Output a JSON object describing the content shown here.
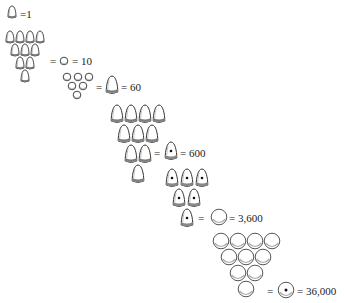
{
  "colors": {
    "stroke": "#333333",
    "shade": "#888888",
    "fill": "#ffffff"
  },
  "equations": [
    {
      "id": "small-cone",
      "token": "small-cone",
      "count": 1,
      "label": "=1"
    },
    {
      "id": "small-sphere",
      "group": {
        "token": "small-cone",
        "count": 10,
        "rows": [
          4,
          3,
          2,
          1
        ]
      },
      "token": "small-sphere",
      "eq1": "=",
      "eq2": "= 10"
    },
    {
      "id": "large-cone",
      "group": {
        "token": "small-sphere",
        "count": 6,
        "rows": [
          3,
          2,
          1
        ]
      },
      "token": "large-cone",
      "eq1": "=",
      "eq2": "= 60"
    },
    {
      "id": "punched-large-cone",
      "group": {
        "token": "large-cone",
        "count": 10,
        "rows": [
          4,
          3,
          2,
          1
        ]
      },
      "token": "punched-large-cone",
      "eq1": "=",
      "eq2": "= 600"
    },
    {
      "id": "large-sphere",
      "group": {
        "token": "punched-large-cone",
        "count": 6,
        "rows": [
          3,
          2,
          1
        ]
      },
      "token": "large-sphere",
      "eq1": "=",
      "eq2": "= 3,600"
    },
    {
      "id": "punched-large-sphere",
      "group": {
        "token": "large-sphere",
        "count": 10,
        "rows": [
          4,
          3,
          2,
          1
        ]
      },
      "token": "punched-large-sphere",
      "eq1": "=",
      "eq2": "= 36,000"
    }
  ]
}
